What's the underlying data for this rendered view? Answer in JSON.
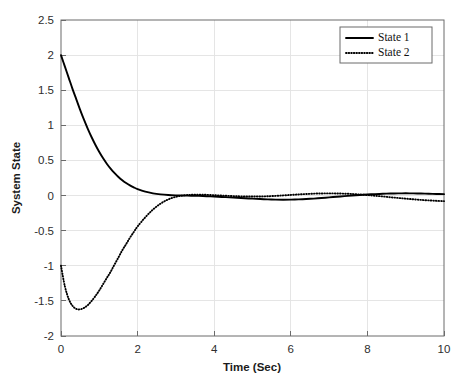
{
  "chart_data": {
    "type": "line",
    "title": "",
    "xlabel": "Time (Sec)",
    "ylabel": "System State",
    "xlim": [
      0,
      10
    ],
    "ylim": [
      -2,
      2.5
    ],
    "grid": true,
    "legend_position": "top-right",
    "xticks": [
      "0",
      "2",
      "4",
      "6",
      "8",
      "10"
    ],
    "xtick_values": [
      0,
      2,
      4,
      6,
      8,
      10
    ],
    "yticks": [
      "2.5",
      "2",
      "1.5",
      "1",
      "0.5",
      "0",
      "-0.5",
      "-1",
      "-1.5",
      "-2"
    ],
    "ytick_values": [
      2.5,
      2,
      1.5,
      1,
      0.5,
      0,
      -0.5,
      -1,
      -1.5,
      -2
    ],
    "x": [
      0,
      0.1,
      0.2,
      0.3,
      0.4,
      0.5,
      0.6,
      0.7,
      0.8,
      0.9,
      1.0,
      1.1,
      1.2,
      1.3,
      1.4,
      1.5,
      1.6,
      1.7,
      1.8,
      1.9,
      2.0,
      2.2,
      2.4,
      2.6,
      2.8,
      3.0,
      3.2,
      3.4,
      3.6,
      3.8,
      4.0,
      4.2,
      4.4,
      4.6,
      4.8,
      5.0,
      5.2,
      5.4,
      5.6,
      5.8,
      6.0,
      6.2,
      6.4,
      6.6,
      6.8,
      7.0,
      7.2,
      7.4,
      7.6,
      7.8,
      8.0,
      8.2,
      8.4,
      8.6,
      8.8,
      9.0,
      9.2,
      9.4,
      9.6,
      9.8,
      10.0
    ],
    "series": [
      {
        "name": "State 1",
        "style": "solid",
        "color": "#000000",
        "values": [
          2.0,
          1.84,
          1.68,
          1.52,
          1.37,
          1.22,
          1.08,
          0.95,
          0.83,
          0.72,
          0.62,
          0.53,
          0.45,
          0.38,
          0.32,
          0.265,
          0.218,
          0.178,
          0.144,
          0.116,
          0.092,
          0.056,
          0.032,
          0.017,
          0.008,
          0.003,
          0.0,
          -0.002,
          -0.005,
          -0.009,
          -0.014,
          -0.02,
          -0.026,
          -0.032,
          -0.038,
          -0.044,
          -0.05,
          -0.055,
          -0.058,
          -0.059,
          -0.058,
          -0.055,
          -0.05,
          -0.043,
          -0.035,
          -0.026,
          -0.017,
          -0.008,
          0.0,
          0.008,
          0.015,
          0.021,
          0.026,
          0.029,
          0.031,
          0.032,
          0.031,
          0.029,
          0.026,
          0.023,
          0.02
        ]
      },
      {
        "name": "State 2",
        "style": "dotted",
        "color": "#000000",
        "values": [
          -1.0,
          -1.29,
          -1.47,
          -1.57,
          -1.615,
          -1.62,
          -1.6,
          -1.56,
          -1.5,
          -1.43,
          -1.35,
          -1.26,
          -1.17,
          -1.08,
          -0.98,
          -0.88,
          -0.78,
          -0.69,
          -0.6,
          -0.52,
          -0.44,
          -0.31,
          -0.2,
          -0.115,
          -0.055,
          -0.018,
          0.002,
          0.01,
          0.012,
          0.01,
          0.005,
          0.0,
          -0.005,
          -0.01,
          -0.013,
          -0.014,
          -0.013,
          -0.01,
          -0.005,
          0.002,
          0.009,
          0.016,
          0.022,
          0.027,
          0.03,
          0.031,
          0.03,
          0.027,
          0.022,
          0.015,
          0.007,
          -0.003,
          -0.013,
          -0.024,
          -0.034,
          -0.044,
          -0.053,
          -0.062,
          -0.069,
          -0.075,
          -0.08
        ]
      }
    ]
  },
  "legend": {
    "entries": [
      {
        "label": "State 1",
        "style": "solid"
      },
      {
        "label": "State 2",
        "style": "dotted"
      }
    ]
  },
  "axes": {
    "x_title": "Time (Sec)",
    "y_title": "System State"
  }
}
